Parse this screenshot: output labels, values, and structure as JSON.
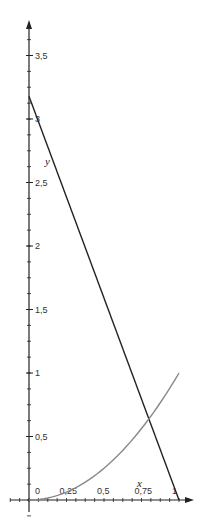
{
  "chart_data": {
    "type": "line",
    "title": "",
    "xlabel": "x",
    "ylabel": "y",
    "xlim": [
      0,
      1
    ],
    "ylim": [
      0,
      3.5
    ],
    "grid": false,
    "legend": "none",
    "x_ticks": [
      "0",
      "0,25",
      "0,5",
      "0,75",
      "1"
    ],
    "y_ticks": [
      "0,5",
      "1",
      "1,5",
      "2",
      "2,5",
      "3",
      "3,5"
    ],
    "series": [
      {
        "name": "decreasing line",
        "color": "#222222",
        "x": [
          0,
          1
        ],
        "values": [
          3.18,
          0
        ]
      },
      {
        "name": "x squared",
        "color": "#888888",
        "x": [
          0,
          0.25,
          0.5,
          0.75,
          1
        ],
        "values": [
          0,
          0.0625,
          0.25,
          0.5625,
          1
        ]
      }
    ],
    "annotations": [
      {
        "text": "y",
        "x": 0.11,
        "y": 2.7
      },
      {
        "text": "x",
        "x": 0.74,
        "y": 0.2
      }
    ]
  },
  "labels": {
    "x_axis": "x",
    "y_axis": "y",
    "origin": "0"
  },
  "colors": {
    "axis": "#222222",
    "line_dark": "#222222",
    "curve_gray": "#888888"
  }
}
